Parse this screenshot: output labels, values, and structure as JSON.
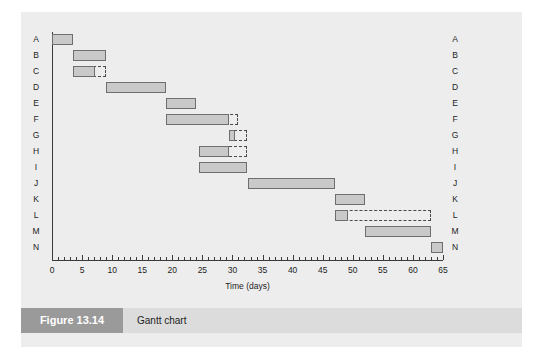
{
  "figure": {
    "number_label": "Figure 13.14",
    "caption": "Gantt chart"
  },
  "chart_data": {
    "type": "bar",
    "orientation": "horizontal",
    "subtype": "gantt",
    "title": "Gantt chart",
    "xlabel": "Time (days)",
    "ylabel": "",
    "xlim": [
      0,
      65
    ],
    "xticks": [
      0,
      5,
      10,
      15,
      20,
      25,
      30,
      35,
      40,
      45,
      50,
      55,
      60,
      65
    ],
    "xtick_labels": [
      "0",
      "5",
      "10",
      "15",
      "20",
      "25",
      "30",
      "35",
      "40",
      "45",
      "50",
      "55",
      "60",
      "65"
    ],
    "minor_tick_interval": 1,
    "grid": false,
    "legend": null,
    "categories": [
      "A",
      "B",
      "C",
      "D",
      "E",
      "F",
      "G",
      "H",
      "I",
      "J",
      "K",
      "L",
      "M",
      "N"
    ],
    "right_axis_labels": [
      "A",
      "B",
      "C",
      "D",
      "E",
      "F",
      "G",
      "H",
      "I",
      "J",
      "K",
      "L",
      "M",
      "N"
    ],
    "tasks": [
      {
        "name": "A",
        "start": 0,
        "end": 3.5,
        "duration": 3.5,
        "float_end": 3.5,
        "float": 0
      },
      {
        "name": "B",
        "start": 3.5,
        "end": 9,
        "duration": 5.5,
        "float_end": 9,
        "float": 0
      },
      {
        "name": "C",
        "start": 3.5,
        "end": 7.2,
        "duration": 3.7,
        "float_end": 9,
        "float": 1.8
      },
      {
        "name": "D",
        "start": 9,
        "end": 19,
        "duration": 10,
        "float_end": 19,
        "float": 0
      },
      {
        "name": "E",
        "start": 19,
        "end": 24,
        "duration": 5,
        "float_end": 24,
        "float": 0
      },
      {
        "name": "F",
        "start": 19,
        "end": 29.5,
        "duration": 10.5,
        "float_end": 31,
        "float": 1.5
      },
      {
        "name": "G",
        "start": 29.5,
        "end": 30.5,
        "duration": 1,
        "float_end": 32.5,
        "float": 2
      },
      {
        "name": "H",
        "start": 24.5,
        "end": 29.5,
        "duration": 5,
        "float_end": 32.5,
        "float": 3
      },
      {
        "name": "I",
        "start": 24.5,
        "end": 32.5,
        "duration": 8,
        "float_end": 32.5,
        "float": 0
      },
      {
        "name": "J",
        "start": 32.5,
        "end": 47,
        "duration": 14.5,
        "float_end": 47,
        "float": 0
      },
      {
        "name": "K",
        "start": 47,
        "end": 52,
        "duration": 5,
        "float_end": 52,
        "float": 0
      },
      {
        "name": "L",
        "start": 47,
        "end": 49.2,
        "duration": 2.2,
        "float_end": 63,
        "float": 13.8
      },
      {
        "name": "M",
        "start": 52,
        "end": 63,
        "duration": 11,
        "float_end": 63,
        "float": 0
      },
      {
        "name": "N",
        "start": 63,
        "end": 65,
        "duration": 2,
        "float_end": 65,
        "float": 0
      }
    ]
  },
  "colors": {
    "panel_background": "#ededed",
    "bar_fill": "#c9c9c9",
    "bar_border": "#6e6e6e",
    "float_border": "#4a4a4a",
    "axis": "#3a3a3a",
    "caption_band": "#dcdcdc",
    "figure_number_box": "#9a9a9a",
    "figure_number_text": "#ffffff",
    "text": "#1d1d1d"
  }
}
